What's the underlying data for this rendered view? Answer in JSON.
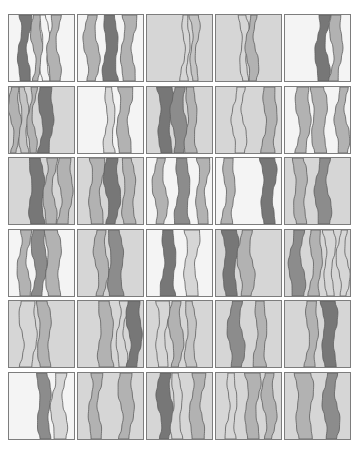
{
  "gallery": {
    "columns": 5,
    "rows": 6,
    "col_x": [
      8,
      77,
      146,
      215,
      284
    ],
    "row_y": [
      14,
      86,
      157,
      229,
      300,
      372
    ],
    "tile_width": 67,
    "tile_height": 68,
    "outline_color": "#5e5e5e",
    "palette": {
      "white": "#f4f4f4",
      "light": "#d6d6d6",
      "mid": "#b2b2b2",
      "midlight": "#c4c4c4",
      "dark": "#8c8c8c",
      "darker": "#777777"
    },
    "tiles": [
      {
        "bg": "white",
        "bands": [
          [
            10,
            10,
            "darker"
          ],
          [
            24,
            8,
            "mid"
          ],
          [
            33,
            6,
            "white"
          ],
          [
            40,
            10,
            "mid"
          ]
        ]
      },
      {
        "bg": "white",
        "bands": [
          [
            8,
            11,
            "mid"
          ],
          [
            27,
            12,
            "darker"
          ],
          [
            44,
            12,
            "mid"
          ]
        ]
      },
      {
        "bg": "light",
        "bands": [
          [
            36,
            6,
            "light"
          ],
          [
            44,
            6,
            "midlight"
          ]
        ]
      },
      {
        "bg": "light",
        "bands": [
          [
            25,
            6,
            "light"
          ],
          [
            32,
            8,
            "mid"
          ]
        ]
      },
      {
        "bg": "white",
        "bands": [
          [
            32,
            11,
            "darker"
          ],
          [
            46,
            10,
            "mid"
          ]
        ]
      },
      {
        "bg": "light",
        "bands": [
          [
            2,
            8,
            "mid"
          ],
          [
            12,
            6,
            "midlight"
          ],
          [
            20,
            6,
            "mid"
          ],
          [
            31,
            12,
            "darker"
          ]
        ]
      },
      {
        "bg": "white",
        "bands": [
          [
            28,
            8,
            "light"
          ],
          [
            40,
            12,
            "mid"
          ]
        ]
      },
      {
        "bg": "light",
        "bands": [
          [
            12,
            12,
            "darker"
          ],
          [
            26,
            12,
            "dark"
          ],
          [
            40,
            9,
            "mid"
          ]
        ]
      },
      {
        "bg": "light",
        "bands": [
          [
            18,
            10,
            "light"
          ],
          [
            48,
            12,
            "mid"
          ]
        ]
      },
      {
        "bg": "white",
        "bands": [
          [
            12,
            12,
            "mid"
          ],
          [
            28,
            12,
            "mid"
          ],
          [
            52,
            10,
            "mid"
          ]
        ]
      },
      {
        "bg": "light",
        "bands": [
          [
            22,
            12,
            "darker"
          ],
          [
            36,
            10,
            "mid"
          ],
          [
            50,
            12,
            "mid"
          ]
        ]
      },
      {
        "bg": "light",
        "bands": [
          [
            12,
            12,
            "mid"
          ],
          [
            28,
            12,
            "darker"
          ],
          [
            46,
            10,
            "mid"
          ]
        ]
      },
      {
        "bg": "white",
        "bands": [
          [
            8,
            10,
            "mid"
          ],
          [
            30,
            12,
            "dark"
          ],
          [
            50,
            10,
            "mid"
          ]
        ]
      },
      {
        "bg": "white",
        "bands": [
          [
            8,
            10,
            "mid"
          ],
          [
            46,
            12,
            "darker"
          ]
        ]
      },
      {
        "bg": "light",
        "bands": [
          [
            10,
            10,
            "mid"
          ],
          [
            32,
            12,
            "dark"
          ]
        ]
      },
      {
        "bg": "white",
        "bands": [
          [
            10,
            10,
            "mid"
          ],
          [
            24,
            12,
            "dark"
          ],
          [
            38,
            12,
            "mid"
          ]
        ]
      },
      {
        "bg": "light",
        "bands": [
          [
            18,
            10,
            "mid"
          ],
          [
            32,
            12,
            "dark"
          ]
        ]
      },
      {
        "bg": "white",
        "bands": [
          [
            16,
            12,
            "darker"
          ],
          [
            38,
            12,
            "light"
          ]
        ]
      },
      {
        "bg": "light",
        "bands": [
          [
            8,
            12,
            "darker"
          ],
          [
            24,
            12,
            "mid"
          ]
        ]
      },
      {
        "bg": "light",
        "bands": [
          [
            6,
            12,
            "dark"
          ],
          [
            26,
            10,
            "mid"
          ],
          [
            40,
            8,
            "light"
          ],
          [
            54,
            8,
            "light"
          ]
        ]
      },
      {
        "bg": "light",
        "bands": [
          [
            12,
            14,
            "light"
          ],
          [
            30,
            10,
            "mid"
          ]
        ]
      },
      {
        "bg": "light",
        "bands": [
          [
            22,
            12,
            "mid"
          ],
          [
            40,
            8,
            "light"
          ],
          [
            50,
            12,
            "darker"
          ]
        ]
      },
      {
        "bg": "light",
        "bands": [
          [
            10,
            10,
            "light"
          ],
          [
            24,
            10,
            "mid"
          ],
          [
            40,
            8,
            "midlight"
          ]
        ]
      },
      {
        "bg": "light",
        "bands": [
          [
            14,
            12,
            "dark"
          ],
          [
            40,
            10,
            "mid"
          ]
        ]
      },
      {
        "bg": "light",
        "bands": [
          [
            22,
            10,
            "mid"
          ],
          [
            38,
            12,
            "darker"
          ]
        ]
      },
      {
        "bg": "white",
        "bands": [
          [
            30,
            10,
            "dark"
          ],
          [
            44,
            12,
            "light"
          ]
        ]
      },
      {
        "bg": "light",
        "bands": [
          [
            12,
            10,
            "mid"
          ],
          [
            42,
            12,
            "mid"
          ]
        ]
      },
      {
        "bg": "light",
        "bands": [
          [
            12,
            12,
            "darker"
          ],
          [
            26,
            8,
            "light"
          ],
          [
            44,
            12,
            "mid"
          ]
        ]
      },
      {
        "bg": "light",
        "bands": [
          [
            12,
            8,
            "light"
          ],
          [
            30,
            12,
            "mid"
          ],
          [
            48,
            10,
            "mid"
          ]
        ]
      },
      {
        "bg": "light",
        "bands": [
          [
            12,
            14,
            "mid"
          ],
          [
            40,
            12,
            "dark"
          ]
        ]
      }
    ]
  }
}
